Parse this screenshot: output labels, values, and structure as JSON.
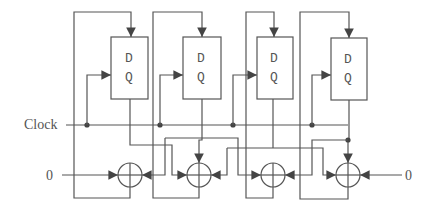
{
  "diagram": {
    "type": "circuit",
    "labels": {
      "clock": "Clock",
      "left_input": "0",
      "right_input": "0"
    },
    "flip_flops": [
      {
        "id": "ff1",
        "d_label": "D",
        "q_label": "Q"
      },
      {
        "id": "ff2",
        "d_label": "D",
        "q_label": "Q"
      },
      {
        "id": "ff3",
        "d_label": "D",
        "q_label": "Q"
      },
      {
        "id": "ff4",
        "d_label": "D",
        "q_label": "Q"
      }
    ],
    "xor_gates": [
      {
        "id": "xor1"
      },
      {
        "id": "xor2"
      },
      {
        "id": "xor3"
      },
      {
        "id": "xor4"
      }
    ],
    "colors": {
      "line": "#555555",
      "junction": "#444444",
      "background": "#ffffff"
    }
  }
}
